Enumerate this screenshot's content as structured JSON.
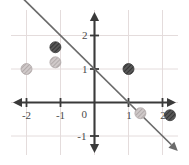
{
  "chart_data": {
    "type": "scatter",
    "title": "",
    "subtitle": "",
    "xlabel": "",
    "ylabel": "",
    "xlim": [
      -2.8,
      2.8
    ],
    "ylim": [
      -1.7,
      2.6
    ],
    "grid": true,
    "legend": "none",
    "grid_color": "#e4dcdc",
    "axis_color": "#3a3a3a",
    "line_color": "#6b6b6b",
    "x_ticks": [
      {
        "value": -2,
        "label": "-2"
      },
      {
        "value": -1,
        "label": "-1"
      },
      {
        "value": 1,
        "label": "1"
      },
      {
        "value": 2,
        "label": "2"
      }
    ],
    "y_ticks": [
      {
        "value": 2,
        "label": "2"
      },
      {
        "value": 1,
        "label": "1"
      },
      {
        "value": -1,
        "label": "-1"
      }
    ],
    "origin_label": "0",
    "series": [
      {
        "name": "line",
        "type": "line",
        "equation": "y = -x + 1",
        "slope": -1,
        "intercept": 1,
        "color": "#6b6b6b",
        "arrows": "both",
        "x_start": -2.45,
        "x_end": 2.45
      },
      {
        "name": "points",
        "type": "scatter",
        "points": [
          {
            "x": -2,
            "y": 1,
            "shade": "light",
            "color": "#b9b2b2"
          },
          {
            "x": -1.15,
            "y": 1.65,
            "shade": "dark",
            "color": "#4d4d4d"
          },
          {
            "x": -1.15,
            "y": 1.2,
            "shade": "light",
            "color": "#b9b2b2"
          },
          {
            "x": 1,
            "y": 1,
            "shade": "dark",
            "color": "#4d4d4d"
          },
          {
            "x": 1.35,
            "y": -0.32,
            "shade": "light",
            "color": "#b9b2b2"
          },
          {
            "x": 2.22,
            "y": -0.38,
            "shade": "dark",
            "color": "#4d4d4d"
          }
        ],
        "marker_radius": 5.5
      }
    ]
  }
}
